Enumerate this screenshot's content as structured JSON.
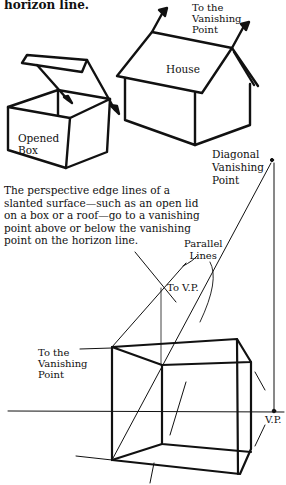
{
  "page": {
    "top_fragment": "horizon line.",
    "paragraph": "The perspective edge lines of a slanted surface—such as an open lid on a box or a roof—go to a vanishing point above or below the vanishing point on the horizon line."
  },
  "figure_top": {
    "labels": {
      "house_vp": "To the\nVanishing\nPoint",
      "house": "House",
      "box": "Opened\nBox"
    }
  },
  "figure_bottom": {
    "labels": {
      "diagonal_vp": "Diagonal\nVanishing\nPoint",
      "parallel_lines": "Parallel\nLines",
      "to_vp": "To V.P.",
      "left_vp": "To the\nVanishing\nPoint",
      "vp": "V.P."
    }
  },
  "colors": {
    "ink": "#111111",
    "paper": "#ffffff"
  }
}
